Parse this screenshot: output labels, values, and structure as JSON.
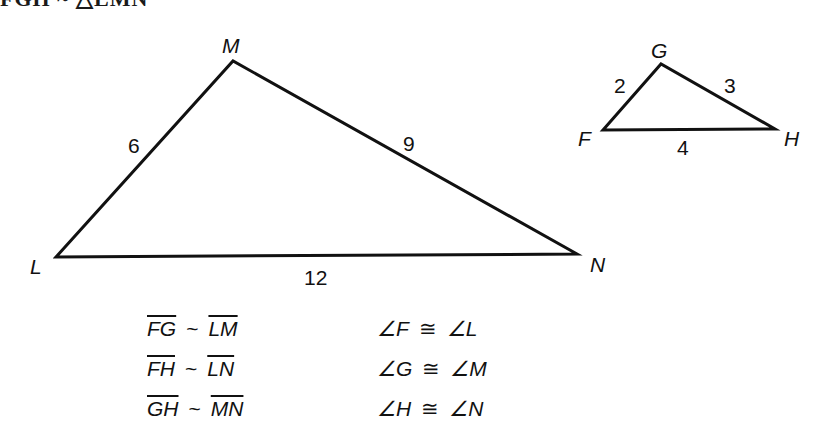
{
  "header": {
    "cut_text": "FGH ~ △LMN"
  },
  "large_triangle": {
    "vertices": {
      "L": "L",
      "M": "M",
      "N": "N"
    },
    "sides": {
      "LM": "6",
      "MN": "9",
      "LN": "12"
    }
  },
  "small_triangle": {
    "vertices": {
      "F": "F",
      "G": "G",
      "H": "H"
    },
    "sides": {
      "FG": "2",
      "GH": "3",
      "FH": "4"
    }
  },
  "side_relations": [
    {
      "left": "FG",
      "op": "~",
      "right": "LM"
    },
    {
      "left": "FH",
      "op": "~",
      "right": "LN"
    },
    {
      "left": "GH",
      "op": "~",
      "right": "MN"
    }
  ],
  "angle_relations": [
    {
      "left": "∠F",
      "op": "≅",
      "right": "∠L"
    },
    {
      "left": "∠G",
      "op": "≅",
      "right": "∠M"
    },
    {
      "left": "∠H",
      "op": "≅",
      "right": "∠N"
    }
  ],
  "colors": {
    "stroke": "#111111",
    "background": "#ffffff"
  }
}
